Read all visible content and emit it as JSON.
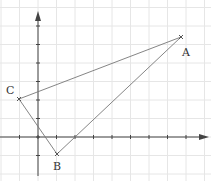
{
  "diagram": {
    "type": "coordinate-triangle",
    "grid": {
      "spacing_px": 18.5,
      "color": "#e3e3e3"
    },
    "origin_px": [
      38,
      137
    ],
    "points": [
      {
        "label": "A",
        "grid": [
          7.8,
          5.4
        ],
        "px": [
          181,
          37
        ],
        "label_px": [
          182,
          56
        ]
      },
      {
        "label": "B",
        "grid": [
          1,
          -1
        ],
        "px": [
          57,
          154
        ],
        "label_px": [
          53,
          170
        ]
      },
      {
        "label": "C",
        "grid": [
          -1,
          2
        ],
        "px": [
          19,
          99
        ],
        "label_px": [
          6,
          94
        ]
      }
    ],
    "line_color": "#777777",
    "axis_color": "#444444"
  }
}
